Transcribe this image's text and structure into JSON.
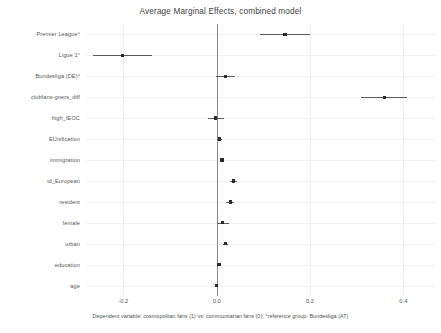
{
  "chart_data": {
    "type": "scatter",
    "title": "Average Marginal Effects, combined model",
    "subtitle": "",
    "xlabel": "",
    "ylabel": "",
    "caption": "Dependent variable: cosmopolitan fans (1) vs. communitarian fans (0); °reference group: Bundesliga (AT)",
    "orientation": "horizontal",
    "grid": true,
    "legend": "none",
    "xlim": [
      -0.28,
      0.47
    ],
    "xticks": [
      -0.2,
      0.0,
      0.2,
      0.4
    ],
    "xticklabels": [
      "-0.2",
      "0.0",
      "0.2",
      "0.4"
    ],
    "zero_reference_line": 0.0,
    "categories": [
      "Premier League°",
      "Ligue 1°",
      "Bundesliga (DE)°",
      "clubfans-gners_diff",
      "high_IEOC",
      "EUnification",
      "immigration",
      "id_European",
      "resident",
      "female",
      "urban",
      "education",
      "age"
    ],
    "points": [
      {
        "label": "Premier League°",
        "estimate": 0.146,
        "ci_low": 0.092,
        "ci_high": 0.199
      },
      {
        "label": "Ligue 1°",
        "estimate": -0.202,
        "ci_low": -0.265,
        "ci_high": -0.138
      },
      {
        "label": "Bundesliga (DE)°",
        "estimate": 0.019,
        "ci_low": -0.002,
        "ci_high": 0.039
      },
      {
        "label": "clubfans-gners_diff",
        "estimate": 0.36,
        "ci_low": 0.31,
        "ci_high": 0.408
      },
      {
        "label": "high_IEOC",
        "estimate": -0.002,
        "ci_low": -0.018,
        "ci_high": 0.015
      },
      {
        "label": "EUnification",
        "estimate": 0.006,
        "ci_low": 0.001,
        "ci_high": 0.011
      },
      {
        "label": "immigration",
        "estimate": 0.011,
        "ci_low": 0.009,
        "ci_high": 0.013
      },
      {
        "label": "id_European",
        "estimate": 0.036,
        "ci_low": 0.029,
        "ci_high": 0.043
      },
      {
        "label": "resident",
        "estimate": 0.029,
        "ci_low": 0.021,
        "ci_high": 0.038
      },
      {
        "label": "female",
        "estimate": 0.013,
        "ci_low": 0.0,
        "ci_high": 0.026
      },
      {
        "label": "urban",
        "estimate": 0.019,
        "ci_low": 0.014,
        "ci_high": 0.025
      },
      {
        "label": "education",
        "estimate": 0.005,
        "ci_low": 0.004,
        "ci_high": 0.007
      },
      {
        "label": "age",
        "estimate": -0.001,
        "ci_low": -0.001,
        "ci_high": -0.001
      }
    ]
  }
}
